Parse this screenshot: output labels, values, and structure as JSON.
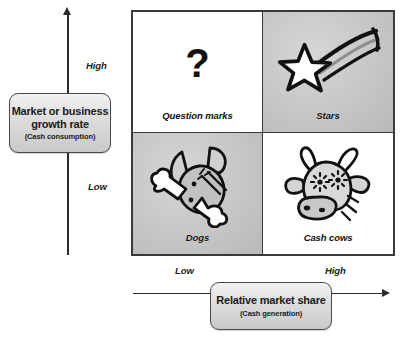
{
  "diagram": {
    "y_axis": {
      "label_title": "Market or business growth rate",
      "label_subtitle": "(Cash consumption)",
      "ticks": {
        "high": "High",
        "low": "Low"
      }
    },
    "x_axis": {
      "label_title": "Relative market share",
      "label_subtitle": "(Cash generation)",
      "ticks": {
        "low": "Low",
        "high": "High"
      }
    },
    "quadrants": [
      {
        "key": "question-marks",
        "label": "Question marks",
        "position": "top-left",
        "growth": "High",
        "share": "Low",
        "fill": "#ffffff",
        "icon": "question-mark-icon"
      },
      {
        "key": "stars",
        "label": "Stars",
        "position": "top-right",
        "growth": "High",
        "share": "High",
        "fill": "#c9c9c9",
        "icon": "shooting-star-icon"
      },
      {
        "key": "dogs",
        "label": "Dogs",
        "position": "bottom-left",
        "growth": "Low",
        "share": "Low",
        "fill": "#c9c9c9",
        "icon": "dog-with-bone-icon"
      },
      {
        "key": "cash-cows",
        "label": "Cash cows",
        "position": "bottom-right",
        "growth": "Low",
        "share": "High",
        "fill": "#ffffff",
        "icon": "cow-head-icon"
      }
    ],
    "colors": {
      "border": "#3a3a3a",
      "axis": "#2b2b2b",
      "box_fill": "#dcdcdc",
      "box_border": "#4a4a4a",
      "text": "#111111"
    }
  }
}
